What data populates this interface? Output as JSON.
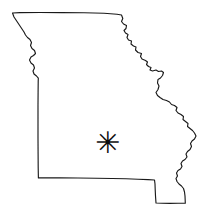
{
  "map": {
    "title": "Missouri",
    "region_type": "US state outline map",
    "background_color": "#ffffff",
    "outline_color": "#1a1a1a",
    "outline_style": "solid thin line",
    "description": "Blank outline map of the state of Missouri showing its straight northern and western borders, the jagged Mississippi River boundary on the east, and the Bootheel in the southeast.",
    "borders": [
      {
        "name": "northwest-missouri-river-border",
        "style": "irregular",
        "description": "Missouri River boundary with Nebraska and Kansas"
      },
      {
        "name": "northern-border",
        "style": "straight",
        "description": "Straight line boundary with Iowa"
      },
      {
        "name": "eastern-mississippi-river-border",
        "style": "irregular",
        "description": "Mississippi River boundary with Illinois, Kentucky and Tennessee"
      },
      {
        "name": "southern-border",
        "style": "straight",
        "description": "Straight line boundary with Arkansas"
      },
      {
        "name": "bootheel",
        "style": "rectangular",
        "description": "Southeastern rectangular projection known as the Missouri Bootheel"
      },
      {
        "name": "western-border",
        "style": "straight",
        "description": "Straight line boundary with Kansas"
      }
    ],
    "markers": [
      {
        "name": "location-marker",
        "glyph": "✳",
        "symbol_name": "asterisk-marker",
        "color": "#0d0d0d",
        "x": 104,
        "y": 143,
        "label": ""
      }
    ]
  }
}
